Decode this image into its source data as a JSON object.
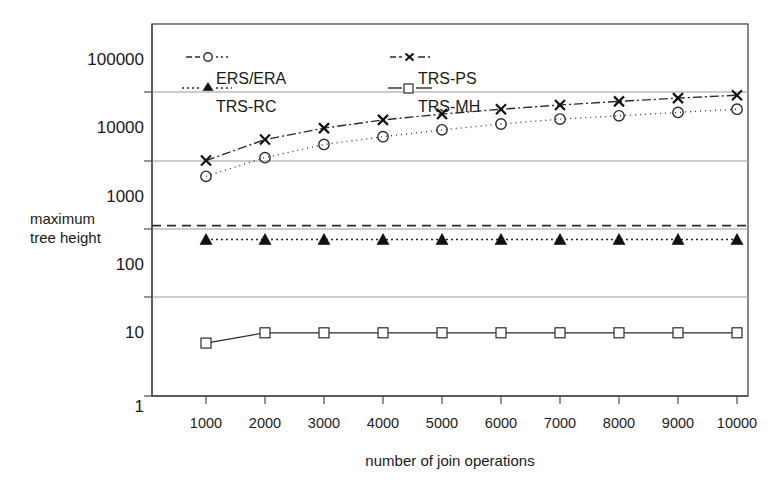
{
  "chart_data": {
    "type": "line",
    "title": "",
    "xlabel": "number of join operations",
    "ylabel": "maximum tree height",
    "ylabel_line1": "maximum",
    "ylabel_line2": "tree height",
    "yscale": "log",
    "ylim": [
      1,
      100000
    ],
    "xlim": [
      500,
      10500
    ],
    "grid": true,
    "legend_position": "upper-left-inside",
    "x": [
      1000,
      2000,
      3000,
      4000,
      5000,
      6000,
      7000,
      8000,
      9000,
      10000
    ],
    "categories": [
      "1000",
      "2000",
      "3000",
      "4000",
      "5000",
      "6000",
      "7000",
      "8000",
      "9000",
      "10000"
    ],
    "y_ticks": [
      1,
      10,
      100,
      1000,
      10000,
      100000
    ],
    "y_tick_labels": [
      "1",
      "10",
      "100",
      "1000",
      "10000",
      "100000"
    ],
    "y_gridlines": [
      3,
      30,
      300,
      3000,
      30000
    ],
    "series": [
      {
        "name": "ERS/ERA",
        "marker": "open-circle",
        "linestyle": "dash-dot",
        "color": "#2b2b2b",
        "values": [
          1700,
          3200,
          5000,
          6500,
          8200,
          10000,
          11800,
          13200,
          14800,
          16500
        ]
      },
      {
        "name": "TRS-PS",
        "marker": "x",
        "linestyle": "dash-dot",
        "color": "#2b2b2b",
        "values": [
          2900,
          5900,
          8700,
          11500,
          14000,
          16500,
          19000,
          21500,
          24000,
          26500
        ]
      },
      {
        "name": "TRS-RC",
        "marker": "filled-triangle",
        "linestyle": "dotted",
        "color": "#111111",
        "values": [
          200,
          200,
          200,
          200,
          200,
          200,
          200,
          200,
          200,
          200
        ]
      },
      {
        "name": "TRS-MH",
        "marker": "open-square",
        "linestyle": "solid",
        "color": "#2b2b2b",
        "values": [
          6,
          8.5,
          8.5,
          8.5,
          8.5,
          8.5,
          8.5,
          8.5,
          8.5,
          8.5
        ]
      }
    ],
    "extra_dashed_line": {
      "name": "upper-dashed-reference",
      "linestyle": "dashed",
      "value": 320
    },
    "legend": [
      {
        "label": "ERS/ERA",
        "marker": "open-circle",
        "linestyle": "dash-dot"
      },
      {
        "label": "TRS-PS",
        "marker": "x",
        "linestyle": "dash-dot"
      },
      {
        "label": "TRS-RC",
        "marker": "filled-triangle",
        "linestyle": "dotted"
      },
      {
        "label": "TRS-MH",
        "marker": "open-square",
        "linestyle": "solid"
      }
    ]
  }
}
